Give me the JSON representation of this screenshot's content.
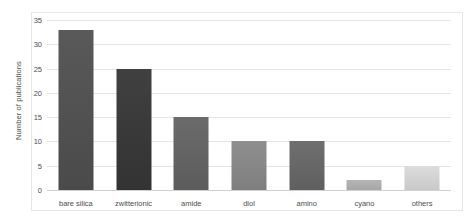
{
  "chart_data": {
    "type": "bar",
    "title": "",
    "xlabel": "",
    "ylabel": "Number of publications",
    "categories": [
      "bare silica",
      "zwitterionic",
      "amide",
      "diol",
      "amino",
      "cyano",
      "others"
    ],
    "values": [
      33,
      25,
      15,
      10,
      10,
      2,
      5
    ],
    "ylim": [
      0,
      35
    ],
    "ytick_labels": [
      "0",
      "5",
      "10",
      "15",
      "20",
      "25",
      "30",
      "35"
    ],
    "ytick_values": [
      0,
      5,
      10,
      15,
      20,
      25,
      30,
      35
    ],
    "grid": true,
    "legend": false,
    "bar_colors": [
      "#595959",
      "#404040",
      "#6b6b6b",
      "#8f8f8f",
      "#6f6f6f",
      "#b5b5b5",
      "#dcdcdc"
    ],
    "bar_colors_bottom": [
      "#4a4a4a",
      "#333333",
      "#5c5c5c",
      "#7e7e7e",
      "#5f5f5f",
      "#a6a6a6",
      "#c9c9c9"
    ],
    "axis_color": "#4d4d4d",
    "grid_color": "#e4e4e4",
    "frame_color": "#e6e6e6",
    "background": "#ffffff"
  }
}
